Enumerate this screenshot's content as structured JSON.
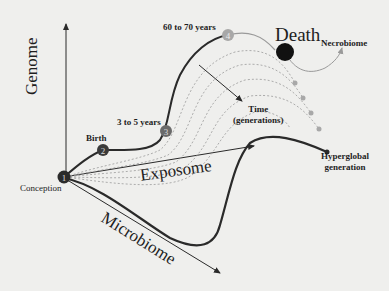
{
  "diagram": {
    "axes": {
      "genome": "Genome",
      "exposome": "Exposome",
      "microbiome": "Microbiome"
    },
    "stages": [
      {
        "number": "1",
        "label": "Conception"
      },
      {
        "number": "2",
        "label": "Birth"
      },
      {
        "number": "3",
        "label": "3 to 5 years"
      },
      {
        "number": "4",
        "label": "60 to 70 years"
      }
    ],
    "death_label": "Death",
    "necrobiome_label": "Necrobiome",
    "time_label_line1": "Time",
    "time_label_line2": "(generations)",
    "hyperglobal_line1": "Hyperglobal",
    "hyperglobal_line2": "generation",
    "colors": {
      "line": "#2a2a2a",
      "faded_line": "#9a9a9a",
      "node_dark": "#2b2b2b",
      "node_light": "#a8a8a8",
      "background": "#efefed"
    }
  }
}
